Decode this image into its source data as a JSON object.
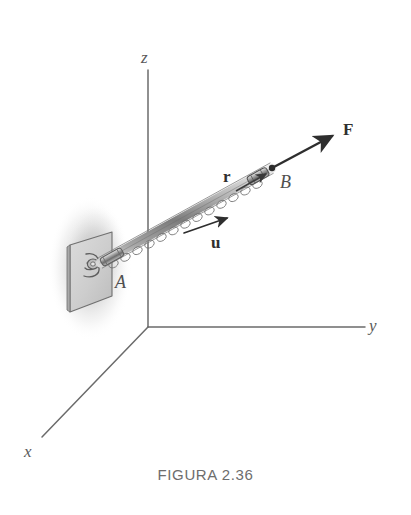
{
  "figure": {
    "caption": "FIGURA 2.36",
    "background_color": "#ffffff",
    "ink_color": "#4a4a4a",
    "axis_color": "#6b6b6b",
    "vector_color": "#2e2e2e",
    "cable_color": "#8d8d8d",
    "plate_fill": "#d0d0d0",
    "shadow_color": "#cfcfcf"
  },
  "axes": {
    "origin": {
      "x": 148,
      "y": 327
    },
    "z": {
      "label": "z",
      "label_x": 141,
      "label_y": 49,
      "from": {
        "x": 148,
        "y": 327
      },
      "to": {
        "x": 148,
        "y": 70
      }
    },
    "y": {
      "label": "y",
      "label_x": 369,
      "label_y": 317,
      "from": {
        "x": 148,
        "y": 327
      },
      "to": {
        "x": 365,
        "y": 327
      }
    },
    "x": {
      "label": "x",
      "label_x": 24,
      "label_y": 443,
      "from": {
        "x": 148,
        "y": 327
      },
      "to": {
        "x": 42,
        "y": 437
      }
    }
  },
  "points": [
    {
      "name": "A",
      "label": "A",
      "label_x": 115,
      "label_y": 273,
      "x": 100,
      "y": 263
    },
    {
      "name": "B",
      "label": "B",
      "label_x": 280,
      "label_y": 173,
      "x": 272,
      "y": 168
    }
  ],
  "vectors": [
    {
      "name": "F",
      "label": "F",
      "label_x": 343,
      "label_y": 121,
      "from": {
        "x": 272,
        "y": 168
      },
      "to": {
        "x": 337,
        "y": 133
      },
      "style": "bold-arrow"
    },
    {
      "name": "r",
      "label": "r",
      "label_x": 223,
      "label_y": 168,
      "from": {
        "x": 100,
        "y": 263
      },
      "to": {
        "x": 272,
        "y": 168
      },
      "style": "along-cable"
    },
    {
      "name": "u",
      "label": "u",
      "label_x": 211,
      "label_y": 234,
      "from": {
        "x": 184,
        "y": 233
      },
      "to": {
        "x": 232,
        "y": 215
      },
      "style": "unit-arrow"
    }
  ],
  "cable": {
    "name": "chain-cable",
    "from": {
      "x": 100,
      "y": 263
    },
    "to": {
      "x": 272,
      "y": 168
    },
    "description": "chain cable with turnbuckle from A to B"
  },
  "plate": {
    "name": "wall-plate",
    "center_x": 92,
    "center_y": 270,
    "description": "square mounting plate with eye bolt at A"
  }
}
